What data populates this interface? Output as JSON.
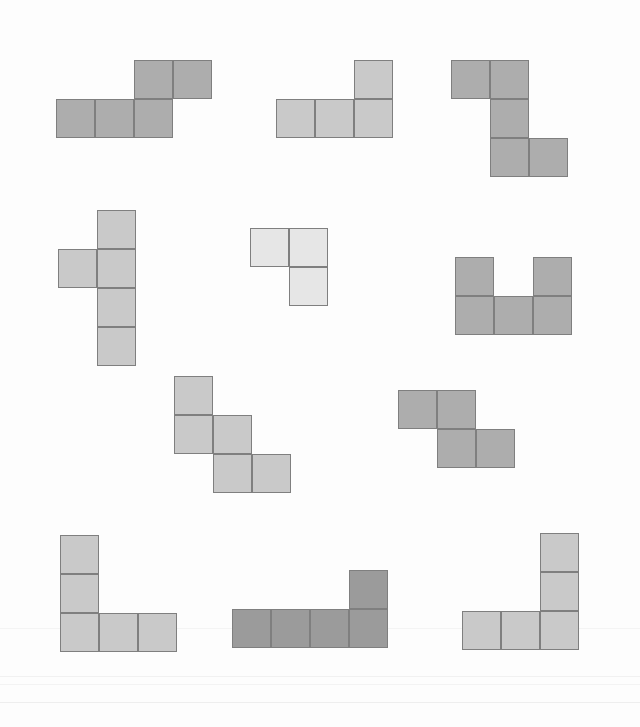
{
  "canvas": {
    "width": 640,
    "height": 727,
    "background": "#fdfdfd",
    "title": "Polyomino Shapes"
  },
  "palette": {
    "mid_gray": "#adadad",
    "light_gray": "#c9c9c9",
    "very_light_gray": "#e6e6e6",
    "dark_gray": "#9b9b9b",
    "stroke": "#7f7f7f"
  },
  "grid": {
    "cell_size": 39,
    "stroke_width": 1.6
  },
  "shapes": [
    {
      "id": "shape-1",
      "name": "s-tetromino-wide",
      "cell_count": 5,
      "fill": "#adadad",
      "origin_x": 56,
      "origin_y": 60,
      "cell_size": 39,
      "cells": [
        [
          2,
          0
        ],
        [
          3,
          0
        ],
        [
          0,
          1
        ],
        [
          1,
          1
        ],
        [
          2,
          1
        ]
      ]
    },
    {
      "id": "shape-2",
      "name": "j-tetromino",
      "cell_count": 4,
      "fill": "#c9c9c9",
      "origin_x": 276,
      "origin_y": 60,
      "cell_size": 39,
      "cells": [
        [
          2,
          0
        ],
        [
          0,
          1
        ],
        [
          1,
          1
        ],
        [
          2,
          1
        ]
      ]
    },
    {
      "id": "shape-3",
      "name": "s-pentomino-tall",
      "cell_count": 5,
      "fill": "#adadad",
      "origin_x": 451,
      "origin_y": 60,
      "cell_size": 39,
      "cells": [
        [
          0,
          0
        ],
        [
          1,
          0
        ],
        [
          1,
          1
        ],
        [
          1,
          2
        ],
        [
          2,
          2
        ]
      ]
    },
    {
      "id": "shape-4",
      "name": "y-pentomino",
      "cell_count": 5,
      "fill": "#c9c9c9",
      "origin_x": 58,
      "origin_y": 210,
      "cell_size": 39,
      "cells": [
        [
          1,
          0
        ],
        [
          0,
          1
        ],
        [
          1,
          1
        ],
        [
          1,
          2
        ],
        [
          1,
          3
        ]
      ]
    },
    {
      "id": "shape-5",
      "name": "v-tromino",
      "cell_count": 3,
      "fill": "#e6e6e6",
      "origin_x": 250,
      "origin_y": 228,
      "cell_size": 39,
      "cells": [
        [
          0,
          0
        ],
        [
          1,
          0
        ],
        [
          1,
          1
        ]
      ]
    },
    {
      "id": "shape-6",
      "name": "u-pentomino",
      "cell_count": 5,
      "fill": "#adadad",
      "origin_x": 455,
      "origin_y": 257,
      "cell_size": 39,
      "cells": [
        [
          0,
          0
        ],
        [
          2,
          0
        ],
        [
          0,
          1
        ],
        [
          1,
          1
        ],
        [
          2,
          1
        ]
      ]
    },
    {
      "id": "shape-7",
      "name": "w-pentomino",
      "cell_count": 5,
      "fill": "#c9c9c9",
      "origin_x": 174,
      "origin_y": 376,
      "cell_size": 39,
      "cells": [
        [
          0,
          0
        ],
        [
          0,
          1
        ],
        [
          1,
          1
        ],
        [
          1,
          2
        ],
        [
          2,
          2
        ]
      ]
    },
    {
      "id": "shape-8",
      "name": "s-tetromino",
      "cell_count": 4,
      "fill": "#adadad",
      "origin_x": 398,
      "origin_y": 390,
      "cell_size": 39,
      "cells": [
        [
          0,
          0
        ],
        [
          1,
          0
        ],
        [
          1,
          1
        ],
        [
          2,
          1
        ]
      ]
    },
    {
      "id": "shape-9",
      "name": "t-pentomino-rotated",
      "cell_count": 5,
      "fill": "#c9c9c9",
      "origin_x": 60,
      "origin_y": 535,
      "cell_size": 39,
      "cells": [
        [
          0,
          0
        ],
        [
          0,
          1
        ],
        [
          0,
          2
        ],
        [
          1,
          2
        ],
        [
          2,
          2
        ]
      ]
    },
    {
      "id": "shape-10",
      "name": "l-pentomino-flat",
      "cell_count": 5,
      "fill": "#9b9b9b",
      "origin_x": 232,
      "origin_y": 570,
      "cell_size": 39,
      "cells": [
        [
          3,
          0
        ],
        [
          0,
          1
        ],
        [
          1,
          1
        ],
        [
          2,
          1
        ],
        [
          3,
          1
        ]
      ]
    },
    {
      "id": "shape-11",
      "name": "v-pentomino",
      "cell_count": 5,
      "fill": "#c9c9c9",
      "origin_x": 462,
      "origin_y": 533,
      "cell_size": 39,
      "cells": [
        [
          2,
          0
        ],
        [
          2,
          1
        ],
        [
          0,
          2
        ],
        [
          1,
          2
        ],
        [
          2,
          2
        ]
      ]
    }
  ],
  "grain_lines": [
    {
      "y": 628,
      "color": "#f4f4f4"
    },
    {
      "y": 676,
      "color": "#f1f1f1"
    },
    {
      "y": 684,
      "color": "#f3f3f3"
    },
    {
      "y": 702,
      "color": "#eeeeee"
    }
  ]
}
